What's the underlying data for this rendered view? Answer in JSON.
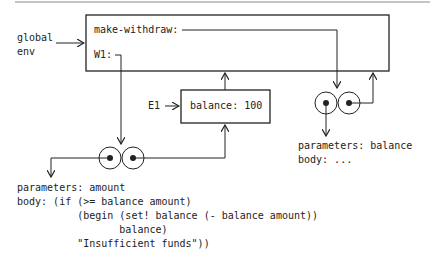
{
  "global_env": {
    "label_line1": "global",
    "label_line2": "env",
    "bindings": [
      {
        "name": "make-withdraw:"
      },
      {
        "name": "W1:"
      }
    ]
  },
  "frame_e1": {
    "label": "E1",
    "binding": "balance: 100"
  },
  "procedure_make_withdraw": {
    "parameters": "parameters: balance",
    "body": "body: ..."
  },
  "procedure_w1": {
    "parameters": "parameters: amount",
    "body_lines": [
      "body: (if (>= balance amount)",
      "          (begin (set! balance (- balance amount))",
      "                 balance)",
      "          \"Insufficient funds\"))"
    ]
  },
  "colors": {
    "line": "#222222",
    "rule": "#888888",
    "background": "#ffffff"
  }
}
